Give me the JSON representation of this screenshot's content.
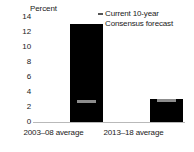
{
  "chart_data": {
    "type": "bar",
    "title": "",
    "subtitle": "",
    "xlabel": "",
    "ylabel": "Percent",
    "ylim": [
      0,
      14
    ],
    "yticks": [
      "0",
      "2",
      "4",
      "6",
      "8",
      "10",
      "12",
      "14"
    ],
    "ytick_values": [
      0,
      2,
      4,
      6,
      8,
      10,
      12,
      14
    ],
    "grid": false,
    "categories": [
      "2003–08 average",
      "2013–18 average"
    ],
    "values": [
      13.1,
      3.1
    ],
    "series": [
      {
        "name": "Bar",
        "values": [
          13.1,
          3.1
        ],
        "color": "#000000"
      },
      {
        "name": "Current 10-year Consensus forecast",
        "values": [
          2.8,
          2.9
        ],
        "color": "#8c8c8c",
        "marker": "dash"
      }
    ],
    "legend": {
      "position": "top-right",
      "marker": "dash",
      "marker_color": "#555555",
      "lines": [
        "Current 10-year",
        "Consensus forecast"
      ]
    },
    "baseline_color": "#b9b9b9"
  },
  "colors": {
    "bar": "#000000",
    "marker": "#8c8c8c",
    "axis": "#b9b9b9",
    "text": "#1a1a1a",
    "background": "#ffffff"
  }
}
